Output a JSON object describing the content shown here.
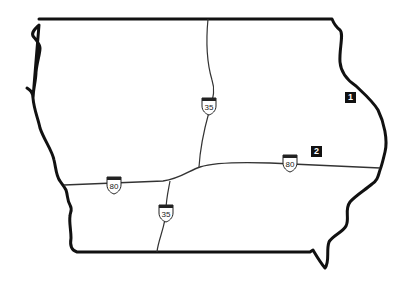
{
  "map": {
    "region": "Iowa",
    "colors": {
      "border": "#111111",
      "road": "#333333",
      "background": "#ffffff",
      "marker_bg": "#111111",
      "marker_text": "#ffffff"
    },
    "highways": [
      {
        "name": "I-80",
        "shields": [
          {
            "label": "80",
            "x": 114,
            "y": 185
          },
          {
            "label": "80",
            "x": 290,
            "y": 163
          }
        ]
      },
      {
        "name": "I-35",
        "shields": [
          {
            "label": "35",
            "x": 209,
            "y": 106
          },
          {
            "label": "35",
            "x": 166,
            "y": 213
          }
        ]
      }
    ],
    "markers": [
      {
        "label": "1",
        "x": 345,
        "y": 92
      },
      {
        "label": "2",
        "x": 311,
        "y": 146
      }
    ]
  }
}
